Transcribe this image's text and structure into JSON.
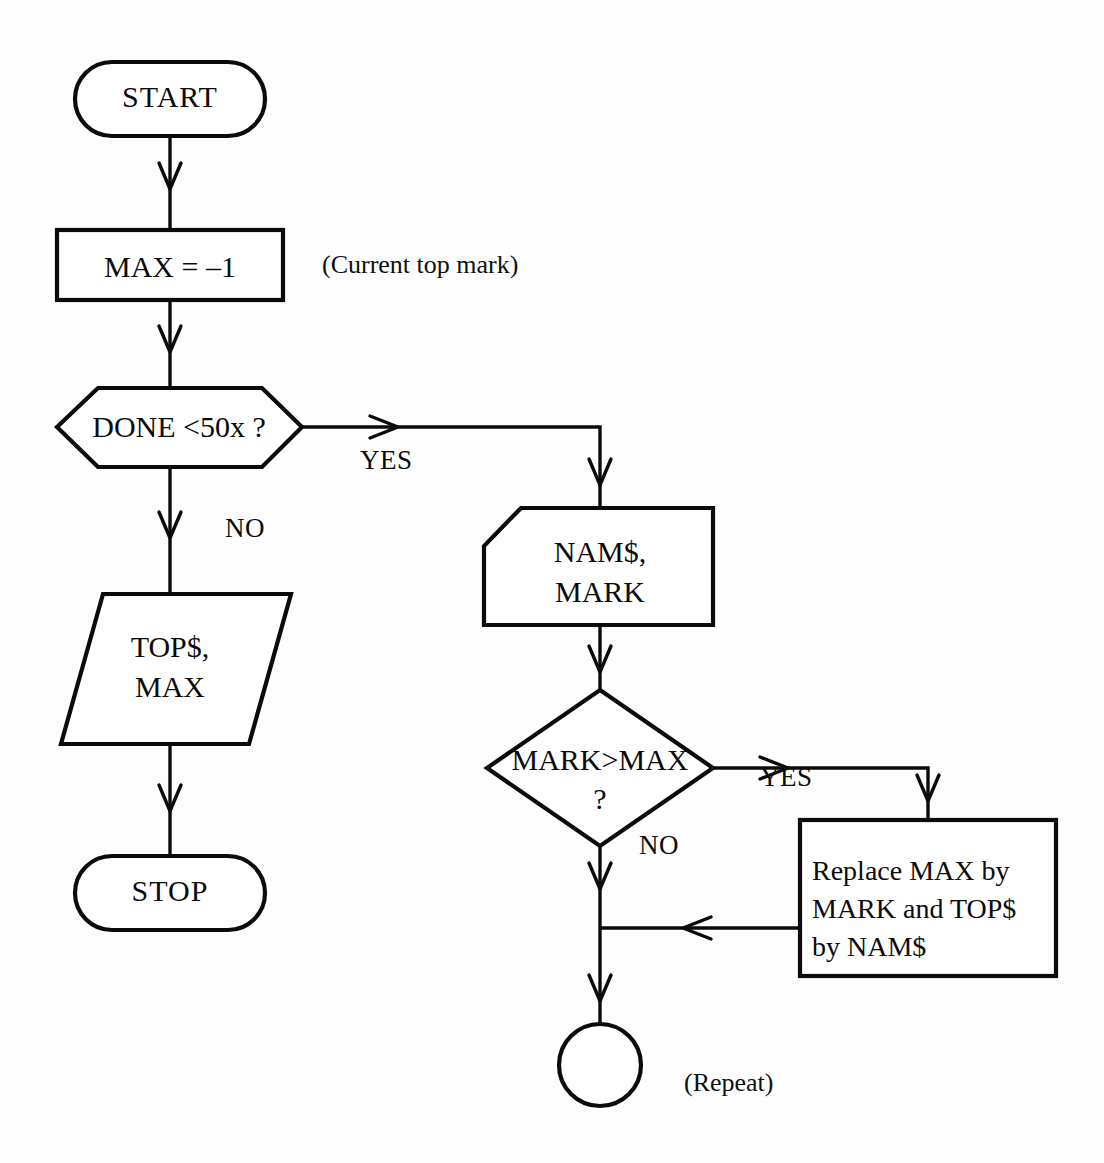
{
  "diagram": {
    "ink_color": "#0b0b0b",
    "background_color": "#fdfdfd"
  },
  "nodes": {
    "start": {
      "label": "START",
      "shape": "terminator-oval"
    },
    "init_max": {
      "label": "MAX = –1",
      "shape": "process-rectangle"
    },
    "done_check": {
      "label": "DONE  <50x ?",
      "shape": "decision-hexagon"
    },
    "output": {
      "label": "TOP$,\nMAX",
      "shape": "output-parallelogram"
    },
    "stop": {
      "label": "STOP",
      "shape": "terminator-oval"
    },
    "input": {
      "label": "NAM$,\nMARK",
      "shape": "manual-input"
    },
    "compare": {
      "label": "MARK>MAX\n?",
      "shape": "decision-diamond"
    },
    "replace": {
      "label": "Replace MAX by\nMARK and TOP$\nby NAM$",
      "shape": "process-rectangle"
    },
    "repeat_connector": {
      "label": "",
      "shape": "connector-circle"
    }
  },
  "edge_labels": {
    "done_yes": "YES",
    "done_no": "NO",
    "compare_yes": "YES",
    "compare_no": "NO"
  },
  "annotations": {
    "current_top_mark": "(Current top mark)",
    "repeat": "(Repeat)"
  }
}
